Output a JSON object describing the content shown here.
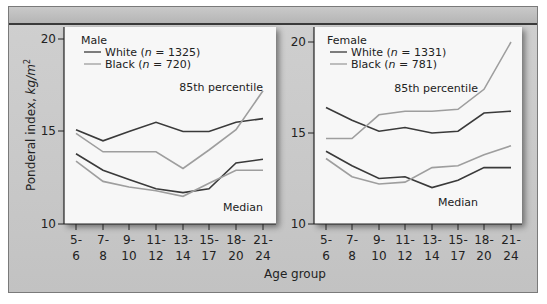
{
  "chart_data": [
    {
      "type": "line",
      "title": "Male",
      "xlabel": "Age group",
      "ylabel": "Ponderal index, kg/m²",
      "ylim": [
        10,
        20
      ],
      "yticks": [
        10,
        15,
        20
      ],
      "categories": [
        "5-6",
        "7-8",
        "9-10",
        "11-12",
        "13-14",
        "15-17",
        "18-20",
        "21-24"
      ],
      "legend": [
        {
          "label": "White (n = 1325)",
          "color": "#3a3a3a"
        },
        {
          "label": "Black (n = 720)",
          "color": "#9e9e9e"
        }
      ],
      "annotations": [
        "85th percentile",
        "Median"
      ],
      "series": [
        {
          "name": "White 85th percentile",
          "color": "#3a3a3a",
          "values": [
            15.1,
            14.5,
            15.0,
            15.5,
            15.0,
            15.0,
            15.5,
            15.7
          ]
        },
        {
          "name": "Black 85th percentile",
          "color": "#9e9e9e",
          "values": [
            14.9,
            13.9,
            13.9,
            13.9,
            13.0,
            14.0,
            15.1,
            17.2
          ]
        },
        {
          "name": "White median",
          "color": "#3a3a3a",
          "values": [
            13.8,
            12.9,
            12.4,
            11.9,
            11.7,
            11.9,
            13.3,
            13.5
          ]
        },
        {
          "name": "Black median",
          "color": "#9e9e9e",
          "values": [
            13.4,
            12.3,
            12.0,
            11.8,
            11.5,
            12.2,
            12.9,
            12.9
          ]
        }
      ]
    },
    {
      "type": "line",
      "title": "Female",
      "xlabel": "Age group",
      "ylabel": "Ponderal index, kg/m²",
      "ylim": [
        10,
        20
      ],
      "yticks": [
        10,
        15,
        20
      ],
      "categories": [
        "5-6",
        "7-8",
        "9-10",
        "11-12",
        "13-14",
        "15-17",
        "18-20",
        "21-24"
      ],
      "legend": [
        {
          "label": "White (n = 1331)",
          "color": "#3a3a3a"
        },
        {
          "label": "Black (n = 781)",
          "color": "#9e9e9e"
        }
      ],
      "annotations": [
        "85th percentile",
        "Median"
      ],
      "series": [
        {
          "name": "White 85th percentile",
          "color": "#3a3a3a",
          "values": [
            16.4,
            15.7,
            15.1,
            15.3,
            15.0,
            15.1,
            16.1,
            16.2
          ]
        },
        {
          "name": "Black 85th percentile",
          "color": "#9e9e9e",
          "values": [
            14.7,
            14.7,
            16.0,
            16.2,
            16.2,
            16.3,
            17.4,
            20.0
          ]
        },
        {
          "name": "White median",
          "color": "#3a3a3a",
          "values": [
            14.0,
            13.2,
            12.5,
            12.6,
            12.0,
            12.4,
            13.1,
            13.1
          ]
        },
        {
          "name": "Black median",
          "color": "#9e9e9e",
          "values": [
            13.6,
            12.6,
            12.2,
            12.3,
            13.1,
            13.2,
            13.8,
            14.3
          ]
        }
      ]
    }
  ],
  "labels": {
    "ylabel_main": "Ponderal index, ",
    "ylabel_unit": "kg/m",
    "ylabel_sup": "2",
    "xlabel": "Age group",
    "pct85": "85th percentile",
    "median": "Median",
    "male": {
      "title": "Male",
      "white_prefix": "White (",
      "white_n": "n",
      "white_suffix": " = 1325)",
      "black_prefix": "Black (",
      "black_n": "n",
      "black_suffix": " = 720)"
    },
    "female": {
      "title": "Female",
      "white_prefix": "White (",
      "white_n": "n",
      "white_suffix": " = 1331)",
      "black_prefix": "Black (",
      "black_n": "n",
      "black_suffix": " = 781)"
    },
    "ytick_20": "20",
    "ytick_15": "15",
    "ytick_10": "10",
    "xticks_top": [
      "5-",
      "7-",
      "9-",
      "11-",
      "13-",
      "15-",
      "18-",
      "21-"
    ],
    "xticks_bottom": [
      "6",
      "8",
      "10",
      "12",
      "14",
      "17",
      "20",
      "24"
    ]
  },
  "colors": {
    "white_line": "#3a3a3a",
    "black_line": "#9e9e9e",
    "panel": "#f7f7f7",
    "frame": "#c8c8c8"
  }
}
